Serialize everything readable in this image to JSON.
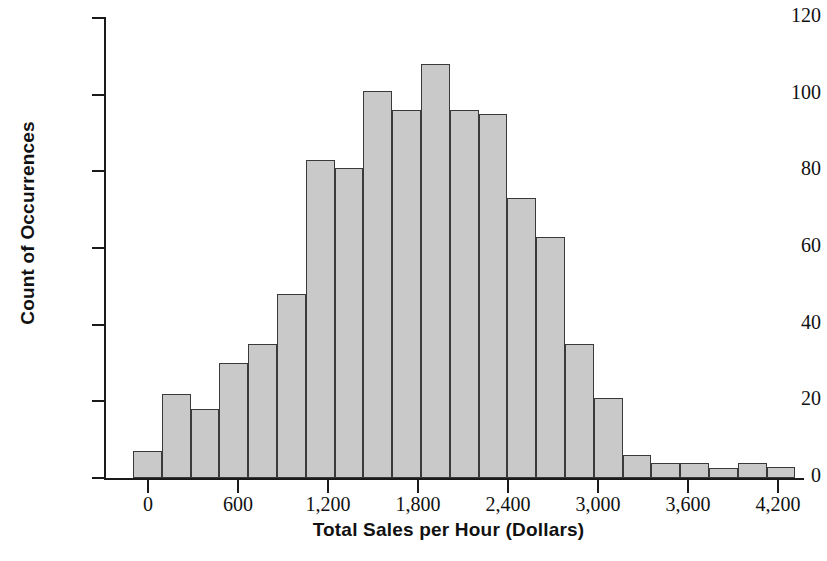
{
  "chart_data": {
    "type": "bar",
    "title": "",
    "xlabel": "Total Sales per Hour (Dollars)",
    "ylabel": "Count of Occurrences",
    "grid": false,
    "legend": "none",
    "xlim": [
      -120,
      4700
    ],
    "ylim": [
      0,
      120
    ],
    "bin_width": 192,
    "x_tick_labels": [
      "0",
      "600",
      "1,200",
      "1,800",
      "2,400",
      "3,000",
      "3,600",
      "4,200"
    ],
    "x_tick_values": [
      0,
      600,
      1200,
      1800,
      2400,
      3000,
      3600,
      4200
    ],
    "y_tick_labels": [
      "0",
      "20",
      "40",
      "60",
      "80",
      "100",
      "120"
    ],
    "y_tick_values": [
      0,
      20,
      40,
      60,
      80,
      100,
      120
    ],
    "bin_starts": [
      -100,
      92,
      284,
      476,
      668,
      860,
      1052,
      1244,
      1436,
      1628,
      1820,
      2012,
      2204,
      2396,
      2588,
      2780,
      2972,
      3164,
      3356,
      3548,
      3740,
      3932,
      4124,
      4316
    ],
    "bin_centers": [
      -4,
      188,
      380,
      572,
      764,
      956,
      1148,
      1340,
      1532,
      1724,
      1916,
      2108,
      2300,
      2492,
      2684,
      2876,
      3068,
      3260,
      3452,
      3644,
      3836,
      4028,
      4220,
      4412
    ],
    "values": [
      7,
      22,
      18,
      30,
      35,
      48,
      83,
      81,
      101,
      96,
      108,
      96,
      95,
      73,
      63,
      35,
      21,
      6,
      4,
      4,
      2.5,
      4,
      3
    ],
    "bar_fill_color": "#c9c9c9",
    "bar_edge_color": "#3a3a3a",
    "axis_color": "#1a1a1a",
    "background_color": "#ffffff"
  }
}
